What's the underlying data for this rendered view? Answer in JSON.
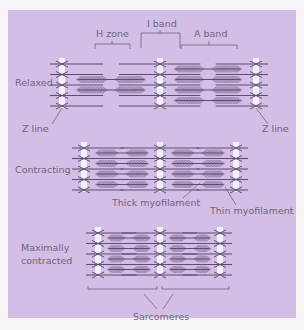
{
  "colors": {
    "page_background": "#f7f5f7",
    "panel": "#d3bfe6",
    "filament": "#5d4d70",
    "thick_hatch": "#9b84ad",
    "z_line": "#f4eefa",
    "text": "#6e6478"
  },
  "labels": {
    "h_zone": "H zone",
    "i_band": "I band",
    "a_band": "A band",
    "relaxed": "Relaxed",
    "z_line_left": "Z line",
    "z_line_right": "Z line",
    "contracting": "Contracting",
    "thick_myofilament": "Thick myofilament",
    "thin_myofilament": "Thin myofilament",
    "maximally_line1": "Maximally",
    "maximally_line2": "contracted",
    "sarcomeres": "Sarcomeres"
  },
  "states": [
    {
      "name": "Relaxed",
      "z_lines_x": [
        62,
        160,
        256
      ],
      "y_top": 60,
      "rows": 4
    },
    {
      "name": "Contracting",
      "z_lines_x": [
        84,
        160,
        236
      ],
      "y_top": 144,
      "rows": 4
    },
    {
      "name": "Maximally contracted",
      "z_lines_x": [
        98,
        160,
        220
      ],
      "y_top": 229,
      "rows": 4
    }
  ]
}
